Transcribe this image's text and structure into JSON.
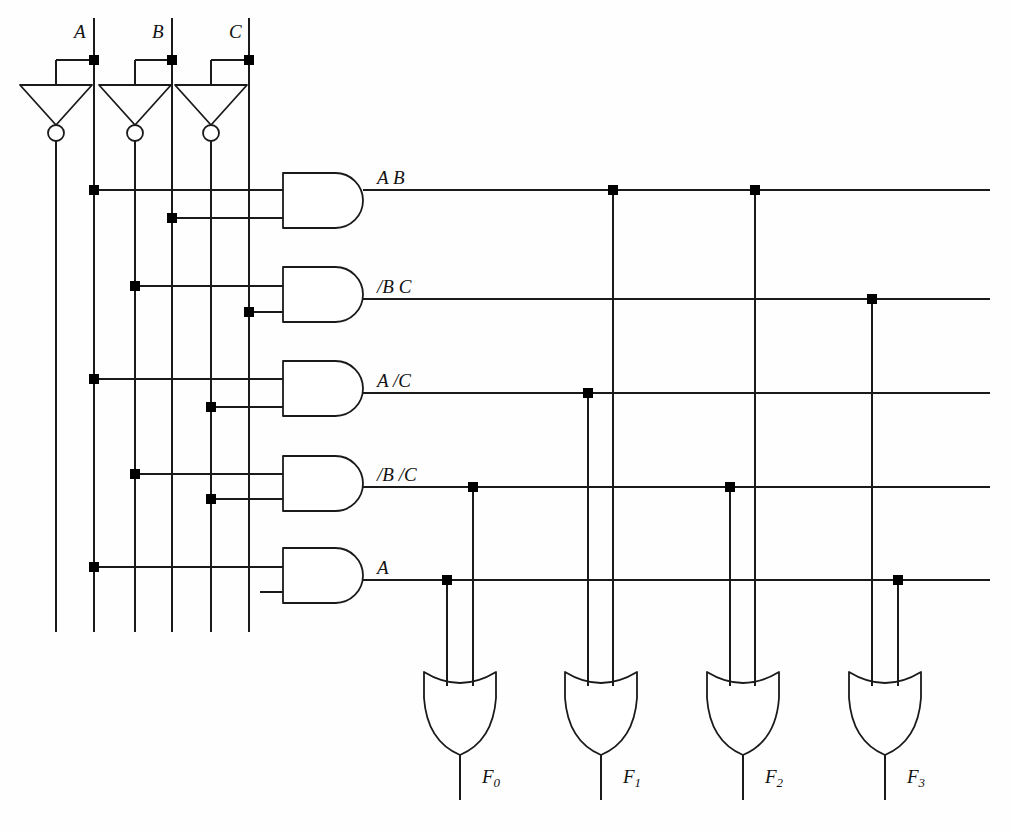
{
  "diagram": {
    "line_color": "#1a1a1a",
    "dot_color": "#000000",
    "background": "#fefefe",
    "width": 1011,
    "height": 832
  },
  "inputs": [
    {
      "id": "A",
      "label": "A",
      "rail_true_x": 94,
      "rail_inv_x": 56,
      "tap_y": 60,
      "inverter_x": 56
    },
    {
      "id": "B",
      "label": "B",
      "rail_true_x": 172,
      "rail_inv_x": 135,
      "tap_y": 60,
      "inverter_x": 135
    },
    {
      "id": "C",
      "label": "C",
      "rail_true_x": 249,
      "rail_inv_x": 211,
      "tap_y": 60,
      "inverter_x": 211
    }
  ],
  "rails": [
    {
      "name": "/A",
      "x": 56,
      "top": 140,
      "bottom": 632
    },
    {
      "name": "A",
      "x": 94,
      "top": 18,
      "bottom": 632
    },
    {
      "name": "/B",
      "x": 135,
      "top": 140,
      "bottom": 632
    },
    {
      "name": "B",
      "x": 172,
      "top": 18,
      "bottom": 632
    },
    {
      "name": "/C",
      "x": 211,
      "top": 140,
      "bottom": 632
    },
    {
      "name": "C",
      "x": 249,
      "top": 18,
      "bottom": 632
    }
  ],
  "inverters": [
    {
      "name": "inverter-A",
      "cx": 56,
      "top": 85,
      "bottom": 125,
      "half_width": 36,
      "bubble_r": 8,
      "input_tap_x": 94,
      "input_tap_y": 60
    },
    {
      "name": "inverter-B",
      "cx": 135,
      "top": 85,
      "bottom": 125,
      "half_width": 36,
      "bubble_r": 8,
      "input_tap_x": 172,
      "input_tap_y": 60
    },
    {
      "name": "inverter-C",
      "cx": 211,
      "top": 85,
      "bottom": 125,
      "half_width": 36,
      "bubble_r": 8,
      "input_tap_x": 249,
      "input_tap_y": 60
    }
  ],
  "and_gates": [
    {
      "id": "p0",
      "label": "A B",
      "out_y": 190,
      "top": 173,
      "bottom": 228,
      "left": 283,
      "right": 363,
      "in_rows": [
        190,
        218
      ],
      "terms": [
        {
          "rail_x": 94,
          "y": 190,
          "name": "A"
        },
        {
          "rail_x": 172,
          "y": 218,
          "name": "B"
        }
      ]
    },
    {
      "id": "p1",
      "label": "/B C",
      "out_y": 299,
      "top": 267,
      "bottom": 322,
      "left": 283,
      "right": 363,
      "in_rows": [
        286,
        312
      ],
      "terms": [
        {
          "rail_x": 135,
          "y": 286,
          "name": "/B"
        },
        {
          "rail_x": 249,
          "y": 312,
          "name": "C"
        }
      ]
    },
    {
      "id": "p2",
      "label": "A /C",
      "out_y": 393,
      "top": 361,
      "bottom": 416,
      "left": 283,
      "right": 363,
      "in_rows": [
        379,
        407
      ],
      "terms": [
        {
          "rail_x": 94,
          "y": 379,
          "name": "A"
        },
        {
          "rail_x": 211,
          "y": 407,
          "name": "/C"
        }
      ]
    },
    {
      "id": "p3",
      "label": "/B /C",
      "out_y": 487,
      "top": 456,
      "bottom": 511,
      "left": 283,
      "right": 363,
      "in_rows": [
        474,
        499
      ],
      "terms": [
        {
          "rail_x": 135,
          "y": 474,
          "name": "/B"
        },
        {
          "rail_x": 211,
          "y": 499,
          "name": "/C"
        }
      ]
    },
    {
      "id": "p4",
      "label": "A",
      "out_y": 580,
      "top": 548,
      "bottom": 603,
      "left": 283,
      "right": 363,
      "in_rows": [
        567,
        592
      ],
      "terms": [
        {
          "rail_x": 94,
          "y": 567,
          "name": "A"
        }
      ],
      "unconnected_stub": {
        "y": 592,
        "from_x": 260,
        "to_x": 283
      }
    }
  ],
  "product_lines": [
    {
      "id": "A B",
      "y": 190,
      "x_start": 363,
      "x_end": 990
    },
    {
      "id": "/B C",
      "y": 299,
      "x_start": 363,
      "x_end": 990
    },
    {
      "id": "A /C",
      "y": 393,
      "x_start": 363,
      "x_end": 990
    },
    {
      "id": "/B /C",
      "y": 487,
      "x_start": 363,
      "x_end": 990
    },
    {
      "id": "A",
      "y": 580,
      "x_start": 363,
      "x_end": 990
    }
  ],
  "or_gates": [
    {
      "id": "F0",
      "label": "F",
      "sub": "0",
      "cx": 460,
      "left_leg_x": 447,
      "right_leg_x": 473,
      "body_top": 672,
      "body_bottom": 755,
      "half_width": 36,
      "out_y": 800,
      "inputs": [
        {
          "term": "A",
          "x": 447,
          "y": 580
        },
        {
          "term": "/B /C",
          "x": 473,
          "y": 487
        }
      ]
    },
    {
      "id": "F1",
      "label": "F",
      "sub": "1",
      "cx": 601,
      "left_leg_x": 588,
      "right_leg_x": 613,
      "body_top": 672,
      "body_bottom": 755,
      "half_width": 36,
      "out_y": 800,
      "inputs": [
        {
          "term": "A /C",
          "x": 588,
          "y": 393
        },
        {
          "term": "A B",
          "x": 613,
          "y": 190
        }
      ]
    },
    {
      "id": "F2",
      "label": "F",
      "sub": "2",
      "cx": 743,
      "left_leg_x": 730,
      "right_leg_x": 755,
      "body_top": 672,
      "body_bottom": 755,
      "half_width": 36,
      "out_y": 800,
      "inputs": [
        {
          "term": "/B /C",
          "x": 730,
          "y": 487
        },
        {
          "term": "A B",
          "x": 755,
          "y": 190
        }
      ]
    },
    {
      "id": "F3",
      "label": "F",
      "sub": "3",
      "cx": 885,
      "left_leg_x": 872,
      "right_leg_x": 898,
      "body_top": 672,
      "body_bottom": 755,
      "half_width": 36,
      "out_y": 800,
      "inputs": [
        {
          "term": "/B C",
          "x": 872,
          "y": 299
        },
        {
          "term": "A",
          "x": 898,
          "y": 580
        }
      ]
    }
  ],
  "junction_dots": [
    {
      "x": 94,
      "y": 60,
      "at": "A-input-tap"
    },
    {
      "x": 172,
      "y": 60,
      "at": "B-input-tap"
    },
    {
      "x": 249,
      "y": 60,
      "at": "C-input-tap"
    },
    {
      "x": 94,
      "y": 190,
      "at": "A-to-p0"
    },
    {
      "x": 172,
      "y": 218,
      "at": "B-to-p0"
    },
    {
      "x": 135,
      "y": 286,
      "at": "notB-to-p1"
    },
    {
      "x": 249,
      "y": 312,
      "at": "C-to-p1"
    },
    {
      "x": 94,
      "y": 379,
      "at": "A-to-p2"
    },
    {
      "x": 211,
      "y": 407,
      "at": "notC-to-p2"
    },
    {
      "x": 135,
      "y": 474,
      "at": "notB-to-p3"
    },
    {
      "x": 211,
      "y": 499,
      "at": "notC-to-p3"
    },
    {
      "x": 94,
      "y": 567,
      "at": "A-to-p4"
    },
    {
      "x": 613,
      "y": 190,
      "at": "AB-to-F1"
    },
    {
      "x": 755,
      "y": 190,
      "at": "AB-to-F2"
    },
    {
      "x": 872,
      "y": 299,
      "at": "notBC-to-F3"
    },
    {
      "x": 588,
      "y": 393,
      "at": "AnotC-to-F1"
    },
    {
      "x": 473,
      "y": 487,
      "at": "notBnotC-to-F0"
    },
    {
      "x": 730,
      "y": 487,
      "at": "notBnotC-to-F2"
    },
    {
      "x": 447,
      "y": 580,
      "at": "A-to-F0"
    },
    {
      "x": 898,
      "y": 580,
      "at": "A-to-F3"
    }
  ],
  "labels": {
    "input_A": "A",
    "input_B": "B",
    "input_C": "C",
    "term_0": "A B",
    "term_1": "/B C",
    "term_2": "A /C",
    "term_3": "/B /C",
    "term_4": "A",
    "out_0": "F",
    "out_0_sub": "0",
    "out_1": "F",
    "out_1_sub": "1",
    "out_2": "F",
    "out_2_sub": "2",
    "out_3": "F",
    "out_3_sub": "3"
  }
}
